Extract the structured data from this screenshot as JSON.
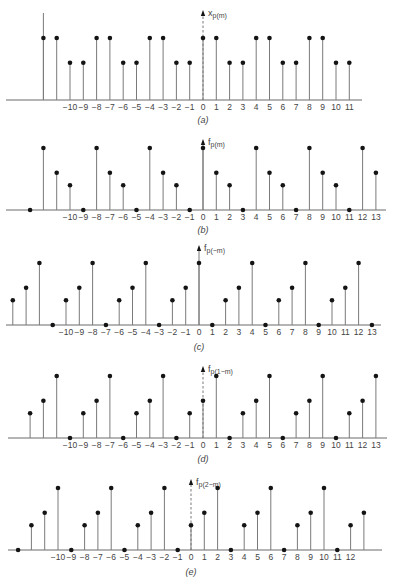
{
  "colors": {
    "stem": "#7a7a7a",
    "dot": "#141414",
    "axis": "#6a6a6a",
    "text": "#444444"
  },
  "chart_data": [
    {
      "type": "stem",
      "panel": "a",
      "caption": "(a)",
      "ylabel": "x",
      "ylabel_sub": "p(m)",
      "geometry": {
        "x0": 203,
        "dx": 13.3,
        "axis_y": 100,
        "unit_px": 62,
        "axis_x1": 6,
        "axis_x2": 362,
        "label_y": 110,
        "caption_y": 123,
        "arrow_top": 10,
        "arrow_dashed": true,
        "label_from": -10,
        "label_to": 11
      },
      "tall_axis_line": {
        "x": -12,
        "top": 13
      },
      "x": [
        -12,
        -11,
        -10,
        -9,
        -8,
        -7,
        -6,
        -5,
        -4,
        -3,
        -2,
        -1,
        0,
        1,
        2,
        3,
        4,
        5,
        6,
        7,
        8,
        9,
        10,
        11
      ],
      "values": [
        1,
        1,
        0.6,
        0.6,
        1,
        1,
        0.6,
        0.6,
        1,
        1,
        0.6,
        0.6,
        1,
        1,
        0.6,
        0.6,
        1,
        1,
        0.6,
        0.6,
        1,
        1,
        0.6,
        0.6
      ]
    },
    {
      "type": "stem",
      "panel": "b",
      "caption": "(b)",
      "ylabel": "f",
      "ylabel_sub": "p(m)",
      "geometry": {
        "x0": 203,
        "dx": 13.3,
        "axis_y": 210,
        "unit_px": 62,
        "axis_x1": 6,
        "axis_x2": 386,
        "label_y": 220,
        "caption_y": 233,
        "arrow_top": 139,
        "arrow_dashed": false,
        "label_from": -10,
        "label_to": 13
      },
      "x": [
        -13,
        -12,
        -11,
        -10,
        -9,
        -8,
        -7,
        -6,
        -5,
        -4,
        -3,
        -2,
        -1,
        0,
        1,
        2,
        3,
        4,
        5,
        6,
        7,
        8,
        9,
        10,
        11,
        12,
        13
      ],
      "values": [
        0,
        1,
        0.6,
        0.4,
        0,
        1,
        0.6,
        0.4,
        0,
        1,
        0.6,
        0.4,
        0,
        1,
        0.6,
        0.4,
        0,
        1,
        0.6,
        0.4,
        0,
        1,
        0.6,
        0.4,
        0,
        1,
        0.6
      ]
    },
    {
      "type": "stem",
      "panel": "c",
      "caption": "(c)",
      "ylabel": "f",
      "ylabel_sub": "p(−m)",
      "geometry": {
        "x0": 199,
        "dx": 13.3,
        "axis_y": 325,
        "unit_px": 62,
        "axis_x1": 6,
        "axis_x2": 381,
        "label_y": 335,
        "caption_y": 350,
        "arrow_top": 245,
        "arrow_dashed": false,
        "label_from": -10,
        "label_to": 13
      },
      "x": [
        -14,
        -13,
        -12,
        -11,
        -10,
        -9,
        -8,
        -7,
        -6,
        -5,
        -4,
        -3,
        -2,
        -1,
        0,
        1,
        2,
        3,
        4,
        5,
        6,
        7,
        8,
        9,
        10,
        11,
        12,
        13
      ],
      "values": [
        0.4,
        0.6,
        1,
        0,
        0.4,
        0.6,
        1,
        0,
        0.4,
        0.6,
        1,
        0,
        0.4,
        0.6,
        1,
        0,
        0.4,
        0.6,
        1,
        0,
        0.4,
        0.6,
        1,
        0,
        0.4,
        0.6,
        1,
        0
      ]
    },
    {
      "type": "stem",
      "panel": "d",
      "caption": "(d)",
      "ylabel": "f",
      "ylabel_sub": "p(1−m)",
      "geometry": {
        "x0": 203,
        "dx": 13.3,
        "axis_y": 438,
        "unit_px": 62,
        "axis_x1": 8,
        "axis_x2": 387,
        "label_y": 448,
        "caption_y": 462,
        "arrow_top": 366,
        "arrow_dashed": true,
        "label_from": -10,
        "label_to": 13
      },
      "x": [
        -13,
        -12,
        -11,
        -10,
        -9,
        -8,
        -7,
        -6,
        -5,
        -4,
        -3,
        -2,
        -1,
        0,
        1,
        2,
        3,
        4,
        5,
        6,
        7,
        8,
        9,
        10,
        11,
        12,
        13
      ],
      "values": [
        0.4,
        0.6,
        1,
        0,
        0.4,
        0.6,
        1,
        0,
        0.4,
        0.6,
        1,
        0,
        0.4,
        0.6,
        1,
        0,
        0.4,
        0.6,
        1,
        0,
        0.4,
        0.6,
        1,
        0,
        0.4,
        0.6,
        1
      ]
    },
    {
      "type": "stem",
      "panel": "e",
      "caption": "(e)",
      "ylabel": "f",
      "ylabel_sub": "p(2−m)",
      "geometry": {
        "x0": 191,
        "dx": 13.3,
        "axis_y": 550,
        "unit_px": 62,
        "axis_x1": 8,
        "axis_x2": 382,
        "label_y": 560,
        "caption_y": 575,
        "arrow_top": 479,
        "arrow_dashed": true,
        "label_from": -10,
        "label_to": 12
      },
      "x": [
        -13,
        -12,
        -11,
        -10,
        -9,
        -8,
        -7,
        -6,
        -5,
        -4,
        -3,
        -2,
        -1,
        0,
        1,
        2,
        3,
        4,
        5,
        6,
        7,
        8,
        9,
        10,
        11,
        12,
        13
      ],
      "values": [
        0,
        0.4,
        0.6,
        1,
        0,
        0.4,
        0.6,
        1,
        0,
        0.4,
        0.6,
        1,
        0,
        0.4,
        0.6,
        1,
        0,
        0.4,
        0.6,
        1,
        0,
        0.4,
        0.6,
        1,
        0,
        0.4,
        0.6
      ]
    }
  ]
}
